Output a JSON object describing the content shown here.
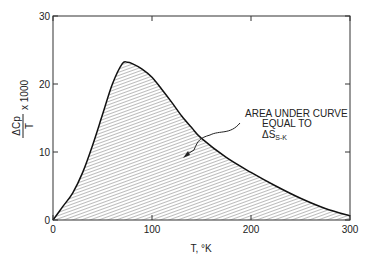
{
  "chart_data": {
    "type": "area",
    "title": "",
    "xlabel": "T, °K",
    "ylabel": "ΔCp / T × 1000",
    "xlim": [
      0,
      300
    ],
    "ylim": [
      0,
      30
    ],
    "x_ticks": [
      "0",
      "100",
      "200",
      "300"
    ],
    "y_ticks": [
      "0",
      "10",
      "20",
      "30"
    ],
    "grid": false,
    "series": [
      {
        "name": "ΔCp/T × 1000",
        "x": [
          0,
          10,
          20,
          30,
          40,
          50,
          60,
          70,
          75,
          80,
          90,
          100,
          110,
          120,
          130,
          140,
          150,
          175,
          200,
          225,
          250,
          275,
          300
        ],
        "values": [
          0,
          2,
          4,
          7,
          11,
          15.5,
          20,
          23,
          23.2,
          23,
          22.2,
          21,
          19.2,
          17.3,
          15.3,
          13.6,
          12,
          9.2,
          7,
          5,
          3.2,
          1.7,
          0.6
        ]
      }
    ],
    "annotations": [
      {
        "text_lines": [
          "AREA UNDER CURVE",
          "EQUAL TO",
          "ΔS"
        ],
        "subscript": "S-K",
        "arrow_to": [
          133,
          11
        ]
      }
    ]
  }
}
